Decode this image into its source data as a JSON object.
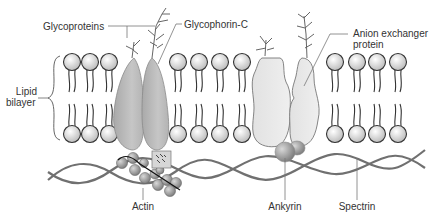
{
  "diagram": {
    "labels": {
      "glycoproteins": "Glycoproteins",
      "glycophorin_c": "Glycophorin-C",
      "anion_exchanger_line1": "Anion exchanger",
      "anion_exchanger_line2": "protein",
      "lipid_line1": "Lipid",
      "lipid_line2": "bilayer",
      "actin": "Actin",
      "ankyrin": "Ankyrin",
      "spectrin": "Spectrin"
    },
    "colors": {
      "lipid_head_fill": "#e6e6e6",
      "lipid_outline": "#333333",
      "protein_dark": "#b9b9b9",
      "protein_light": "#e8e8e8",
      "spectrin": "#6e6e6e",
      "actin_bead": "#9a9a9a",
      "ankyrin": "#a8a8a8",
      "label_line": "#777777"
    },
    "lipid_heads": {
      "upper_y": 62,
      "lower_y": 134,
      "x_positions": [
        72,
        90,
        109,
        178,
        199,
        220,
        242,
        335,
        357,
        377,
        398
      ]
    }
  }
}
